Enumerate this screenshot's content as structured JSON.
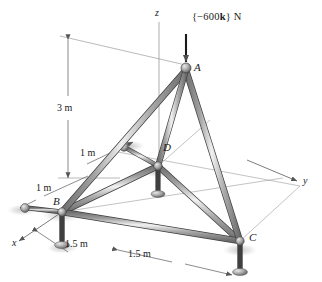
{
  "figure": {
    "type": "space-truss-free-body-diagram",
    "background_color": "#ffffff",
    "member_color": "#8f8f8f",
    "member_outline_color": "#4a4a4a",
    "line_color": "#5a5a5a",
    "text_color": "#1a1a1a"
  },
  "load": {
    "label": "{−600k} N",
    "label_prefix": "{−600",
    "label_vector": "k",
    "label_suffix": "} N",
    "magnitude": 600,
    "unit": "N",
    "direction": "−k",
    "applied_at": "A"
  },
  "axes": [
    {
      "name": "z",
      "label": "z",
      "orientation": "vertical-up"
    },
    {
      "name": "y",
      "label": "y",
      "orientation": "right-depth"
    },
    {
      "name": "x",
      "label": "x",
      "orientation": "left-foreground"
    }
  ],
  "nodes": [
    {
      "id": "A",
      "label": "A",
      "role": "apex-joint"
    },
    {
      "id": "B",
      "label": "B",
      "role": "base-support-joint"
    },
    {
      "id": "C",
      "label": "C",
      "role": "base-support-joint"
    },
    {
      "id": "D",
      "label": "D",
      "role": "base-support-joint"
    }
  ],
  "dimensions": [
    {
      "id": "height",
      "label": "3 m",
      "value": 3,
      "unit": "m",
      "measures": "vertical height of A above base plane"
    },
    {
      "id": "d-offset-upper",
      "label": "1 m",
      "value": 1,
      "unit": "m",
      "measures": "offset to joint D"
    },
    {
      "id": "d-offset-lower",
      "label": "1 m",
      "value": 1,
      "unit": "m",
      "measures": "offset to joint D"
    },
    {
      "id": "base-left",
      "label": "1.5 m",
      "value": 1.5,
      "unit": "m",
      "measures": "base half-span from B"
    },
    {
      "id": "base-right",
      "label": "1.5 m",
      "value": 1.5,
      "unit": "m",
      "measures": "base half-span to C"
    }
  ],
  "members": [
    {
      "from": "A",
      "to": "B"
    },
    {
      "from": "A",
      "to": "C"
    },
    {
      "from": "A",
      "to": "D"
    },
    {
      "from": "B",
      "to": "C"
    },
    {
      "from": "B",
      "to": "D"
    },
    {
      "from": "C",
      "to": "D"
    }
  ],
  "supports": [
    {
      "at": "B",
      "type": "ball-and-socket-post"
    },
    {
      "at": "C",
      "type": "ball-and-socket-post"
    },
    {
      "at": "D",
      "type": "ball-and-socket-post"
    }
  ]
}
